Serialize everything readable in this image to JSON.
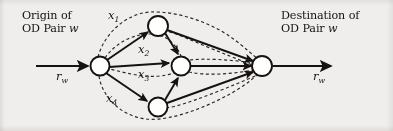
{
  "figure": {
    "kind": "network-diagram",
    "caption_labels": {
      "origin_line1": "Origin of",
      "origin_line2_prefix": "OD Pair ",
      "origin_line2_var": "w",
      "destination_line1": "Destination of",
      "destination_line2_prefix": "OD Pair ",
      "destination_line2_var": "w"
    },
    "flow_labels": {
      "inbound_symbol": "r",
      "inbound_subscript": "w",
      "outbound_symbol": "r",
      "outbound_subscript": "w"
    },
    "path_labels": [
      {
        "symbol": "x",
        "subscript": "1"
      },
      {
        "symbol": "x",
        "subscript": "2"
      },
      {
        "symbol": "x",
        "subscript": "3"
      },
      {
        "symbol": "x",
        "subscript": "4"
      }
    ],
    "colors": {
      "background": "#f0eeec",
      "ink": "#15120f",
      "node_fill": "#ffffff",
      "dashed_path": "#2a2622"
    },
    "nodes": [
      {
        "id": "origin",
        "name": "origin-node",
        "x": 100,
        "y": 66,
        "r": 9.5
      },
      {
        "id": "top",
        "name": "top-node",
        "x": 158,
        "y": 26,
        "r": 10
      },
      {
        "id": "middle",
        "name": "middle-node",
        "x": 181,
        "y": 66,
        "r": 9.5
      },
      {
        "id": "bottom",
        "name": "bottom-node",
        "x": 158,
        "y": 107,
        "r": 9.5
      },
      {
        "id": "destination",
        "name": "destination-node",
        "x": 262,
        "y": 66,
        "r": 10
      }
    ],
    "links": [
      {
        "from": "origin",
        "to": "top",
        "style": "solid"
      },
      {
        "from": "origin",
        "to": "middle",
        "style": "solid"
      },
      {
        "from": "origin",
        "to": "bottom",
        "style": "solid"
      },
      {
        "from": "top",
        "to": "middle",
        "style": "solid"
      },
      {
        "from": "bottom",
        "to": "middle",
        "style": "solid"
      },
      {
        "from": "top",
        "to": "destination",
        "style": "solid"
      },
      {
        "from": "middle",
        "to": "destination",
        "style": "solid"
      },
      {
        "from": "bottom",
        "to": "destination",
        "style": "solid"
      }
    ],
    "routes": [
      {
        "label": "x1",
        "style": "dashed",
        "node_sequence": [
          "origin",
          "top",
          "destination"
        ]
      },
      {
        "label": "x2",
        "style": "dashed",
        "node_sequence": [
          "origin",
          "top",
          "middle",
          "destination"
        ]
      },
      {
        "label": "x3",
        "style": "dashed",
        "node_sequence": [
          "origin",
          "middle",
          "destination"
        ]
      },
      {
        "label": "x4",
        "style": "dashed",
        "node_sequence": [
          "origin",
          "bottom",
          "destination"
        ]
      }
    ]
  }
}
